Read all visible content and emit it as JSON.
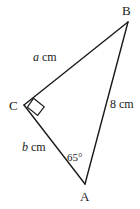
{
  "figure": {
    "type": "right-triangle-diagram",
    "background_color": "#ffffff",
    "stroke_color": "#1a1a1a",
    "vertices": {
      "A": {
        "label": "A",
        "x": 85,
        "y": 184,
        "label_x": 80,
        "label_y": 190
      },
      "B": {
        "label": "B",
        "x": 128,
        "y": 22,
        "label_x": 122,
        "label_y": 4
      },
      "C": {
        "label": "C",
        "x": 24,
        "y": 105,
        "label_x": 9,
        "label_y": 99
      }
    },
    "sides": {
      "CB": {
        "label_var": "a",
        "label_unit": "cm",
        "label_x": 33,
        "label_y": 51
      },
      "CA": {
        "label_var": "b",
        "label_unit": "cm",
        "label_x": 22,
        "label_y": 141
      },
      "AB": {
        "label": "8 cm",
        "label_x": 110,
        "label_y": 98
      }
    },
    "angles": {
      "at_A": {
        "label": "65°",
        "value": 65,
        "unit": "degrees",
        "label_x": 67,
        "label_y": 152
      },
      "at_C": {
        "label": "right-angle-marker",
        "value": 90,
        "unit": "degrees"
      }
    }
  }
}
